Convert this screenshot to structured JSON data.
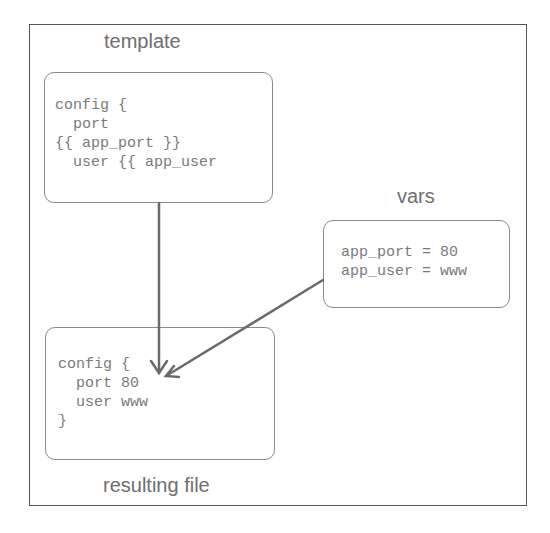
{
  "template": {
    "title": "template",
    "lines": [
      "config {",
      "  port",
      "{{ app_port }}",
      "  user {{ app_user"
    ]
  },
  "vars": {
    "title": "vars",
    "lines": [
      "app_port = 80",
      "app_user = www"
    ]
  },
  "result": {
    "title": "resulting file",
    "lines": [
      " config {",
      "   port 80",
      "   user www",
      " }"
    ]
  },
  "colors": {
    "arrow": "#6a6a6a",
    "box_border": "#8a8a8a",
    "text": "#7a7a7a"
  }
}
